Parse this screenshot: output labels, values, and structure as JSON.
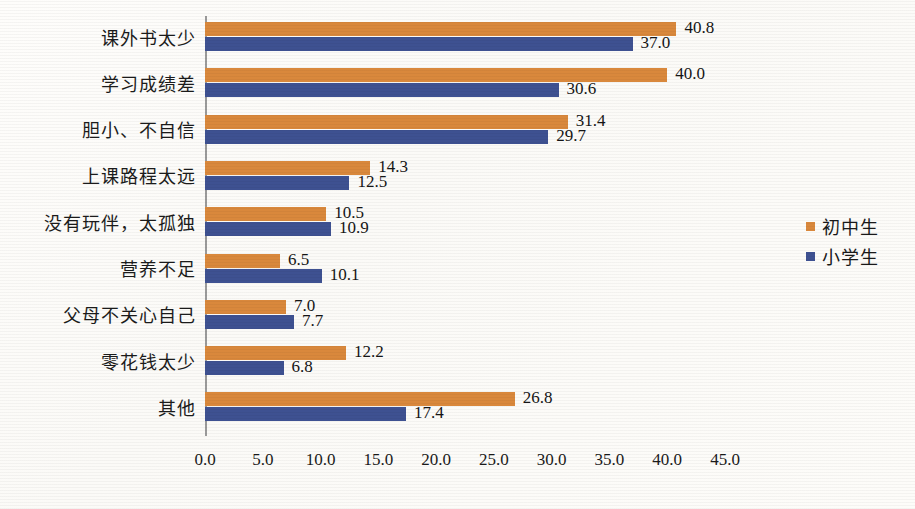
{
  "chart_data": {
    "type": "bar",
    "orientation": "horizontal",
    "title": "",
    "xlabel": "",
    "ylabel": "",
    "xlim": [
      0,
      45
    ],
    "xticks": [
      "0.0",
      "5.0",
      "10.0",
      "15.0",
      "20.0",
      "25.0",
      "30.0",
      "35.0",
      "40.0",
      "45.0"
    ],
    "grid": false,
    "legend_position": "right",
    "categories": [
      "课外书太少",
      "学习成绩差",
      "胆小、不自信",
      "上课路程太远",
      "没有玩伴，太孤独",
      "营养不足",
      "父母不关心自己",
      "零花钱太少",
      "其他"
    ],
    "series": [
      {
        "name": "初中生",
        "color": "#d9883c",
        "values": [
          40.8,
          40.0,
          31.4,
          14.3,
          10.5,
          6.5,
          7.0,
          12.2,
          26.8
        ],
        "labels": [
          "40.8",
          "40.0",
          "31.4",
          "14.3",
          "10.5",
          "6.5",
          "7.0",
          "12.2",
          "26.8"
        ]
      },
      {
        "name": "小学生",
        "color": "#3e5191",
        "values": [
          37.0,
          30.6,
          29.7,
          12.5,
          10.9,
          10.1,
          7.7,
          6.8,
          17.4
        ],
        "labels": [
          "37.0",
          "30.6",
          "29.7",
          "12.5",
          "10.9",
          "10.1",
          "7.7",
          "6.8",
          "17.4"
        ]
      }
    ]
  },
  "legend": {
    "items": [
      {
        "label": "初中生",
        "color": "#d9883c"
      },
      {
        "label": "小学生",
        "color": "#3e5191"
      }
    ]
  }
}
